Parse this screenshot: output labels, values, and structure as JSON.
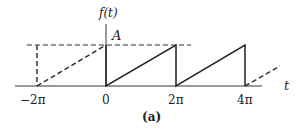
{
  "figure": {
    "ylabel": "f(t)",
    "xlabel": "t",
    "amplitude_label": "A",
    "caption": "(a)",
    "ticks": [
      "−2π",
      "0",
      "2π",
      "4π"
    ]
  },
  "waveform": {
    "type": "sawtooth",
    "period": "2π",
    "amplitude": "A",
    "solid_range": [
      "0",
      "4π"
    ],
    "dashed_extensions": [
      "−2π to 0",
      "beyond 4π"
    ]
  }
}
